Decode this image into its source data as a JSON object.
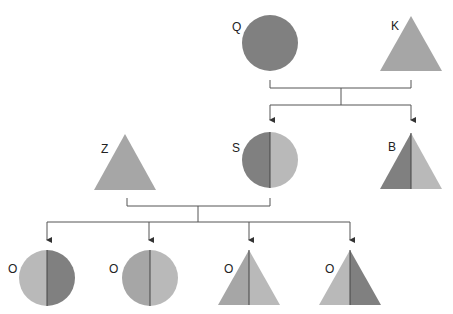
{
  "diagram": {
    "title": "",
    "colors": {
      "dark": "#808080",
      "mid": "#a6a6a6",
      "light": "#b9b9b9",
      "line": "#555555",
      "divider": "#444444"
    },
    "individuals": [
      {
        "id": "Q",
        "label": "Q",
        "shape": "circle",
        "cx": 270,
        "cy": 43,
        "r": 28,
        "fill": "dark",
        "generation": 1,
        "role": "parent"
      },
      {
        "id": "K",
        "label": "K",
        "shape": "triangle",
        "cx": 411,
        "top": 16,
        "bottom": 71,
        "half": 31,
        "fill": "mid",
        "generation": 1,
        "role": "parent"
      },
      {
        "id": "Z",
        "label": "Z",
        "shape": "triangle",
        "cx": 125,
        "top": 134,
        "bottom": 190,
        "half": 31,
        "fill": "mid",
        "generation": 2,
        "role": "parent"
      },
      {
        "id": "S",
        "label": "S",
        "shape": "circle",
        "cx": 270,
        "cy": 160,
        "r": 28,
        "left": "dark",
        "right": "light",
        "generation": 2,
        "role": "child-of-Q-K"
      },
      {
        "id": "B",
        "label": "B",
        "shape": "triangle",
        "cx": 411,
        "top": 133,
        "bottom": 189,
        "half": 31,
        "left": "dark",
        "right": "light",
        "generation": 2,
        "role": "child-of-Q-K"
      },
      {
        "id": "O1",
        "label": "O",
        "shape": "circle",
        "cx": 47,
        "cy": 278,
        "r": 28,
        "left": "light",
        "right": "dark",
        "generation": 3,
        "role": "child-of-Z-S"
      },
      {
        "id": "O2",
        "label": "O",
        "shape": "circle",
        "cx": 150,
        "cy": 278,
        "r": 28,
        "left": "mid",
        "right": "light",
        "generation": 3,
        "role": "child-of-Z-S"
      },
      {
        "id": "O3",
        "label": "O",
        "shape": "triangle",
        "cx": 249,
        "top": 250,
        "bottom": 305,
        "half": 31,
        "left": "mid",
        "right": "light",
        "generation": 3,
        "role": "child-of-Z-S"
      },
      {
        "id": "O4",
        "label": "O",
        "shape": "triangle",
        "cx": 350,
        "top": 250,
        "bottom": 305,
        "half": 31,
        "left": "light",
        "right": "dark",
        "generation": 3,
        "role": "child-of-Z-S"
      }
    ],
    "labels": [
      {
        "for": "Q",
        "text": "Q",
        "x": 232,
        "y": 31
      },
      {
        "for": "K",
        "text": "K",
        "x": 391,
        "y": 30
      },
      {
        "for": "Z",
        "text": "Z",
        "x": 101,
        "y": 153
      },
      {
        "for": "S",
        "text": "S",
        "x": 232,
        "y": 152
      },
      {
        "for": "B",
        "text": "B",
        "x": 388,
        "y": 151
      },
      {
        "for": "O1",
        "text": "O",
        "x": 8,
        "y": 273
      },
      {
        "for": "O2",
        "text": "O",
        "x": 109,
        "y": 273
      },
      {
        "for": "O3",
        "text": "O",
        "x": 224,
        "y": 273
      },
      {
        "for": "O4",
        "text": "O",
        "x": 325,
        "y": 273
      }
    ],
    "families": [
      {
        "parents": [
          "Q",
          "K"
        ],
        "parentX": [
          270,
          411
        ],
        "top": 80,
        "bar": 88,
        "midX": 341,
        "childBar": 105,
        "childX": [
          270,
          411
        ],
        "arrowEnd": 120,
        "children": [
          "S",
          "B"
        ]
      },
      {
        "parents": [
          "Z",
          "S"
        ],
        "parentX": [
          127,
          270
        ],
        "top": 198,
        "bar": 206,
        "midX": 198,
        "childBar": 222,
        "childX": [
          47,
          149,
          249,
          350
        ],
        "arrowEnd": 240,
        "children": [
          "O1",
          "O2",
          "O3",
          "O4"
        ]
      }
    ]
  }
}
